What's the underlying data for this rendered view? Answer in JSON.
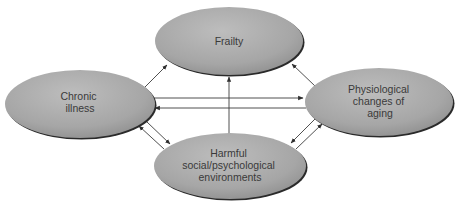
{
  "diagram": {
    "type": "relationship-diagram",
    "colors": {
      "node_fill_light": "#b8b8b8",
      "node_fill_dark": "#8e8e8e",
      "node_edge_shadow": "#2a2a2a",
      "arrow": "#3c3c3c",
      "text": "#3a3a3a",
      "background": "#ffffff"
    },
    "nodes": [
      {
        "id": "frailty",
        "lines": [
          "Frailty"
        ],
        "cx": 229,
        "cy": 41,
        "rx": 74,
        "ry": 34
      },
      {
        "id": "chronic-illness",
        "lines": [
          "Chronic",
          "illness"
        ],
        "cx": 80,
        "cy": 104,
        "rx": 75,
        "ry": 34
      },
      {
        "id": "physiological-changes",
        "lines": [
          "Physiological",
          "changes of",
          "aging"
        ],
        "cx": 379,
        "cy": 102,
        "rx": 74,
        "ry": 34
      },
      {
        "id": "harmful-environments",
        "lines": [
          "Harmful",
          "social/psychological",
          "environments"
        ],
        "cx": 230,
        "cy": 166,
        "rx": 76,
        "ry": 33
      }
    ],
    "edges": [
      {
        "from": "chronic-illness",
        "to": "frailty",
        "direction": "one-way"
      },
      {
        "from": "physiological-changes",
        "to": "frailty",
        "direction": "one-way"
      },
      {
        "from": "harmful-environments",
        "to": "frailty",
        "direction": "one-way"
      },
      {
        "from": "chronic-illness",
        "to": "physiological-changes",
        "direction": "one-way"
      },
      {
        "from": "physiological-changes",
        "to": "chronic-illness",
        "direction": "one-way"
      },
      {
        "from": "chronic-illness",
        "to": "harmful-environments",
        "direction": "one-way"
      },
      {
        "from": "harmful-environments",
        "to": "chronic-illness",
        "direction": "one-way"
      },
      {
        "from": "physiological-changes",
        "to": "harmful-environments",
        "direction": "one-way"
      },
      {
        "from": "harmful-environments",
        "to": "physiological-changes",
        "direction": "one-way"
      }
    ]
  },
  "labels": {
    "frailty": [
      "Frailty"
    ],
    "chronic": [
      "Chronic",
      "illness"
    ],
    "physio": [
      "Physiological",
      "changes of",
      "aging"
    ],
    "harmful": [
      "Harmful",
      "social/psychological",
      "environments"
    ]
  }
}
